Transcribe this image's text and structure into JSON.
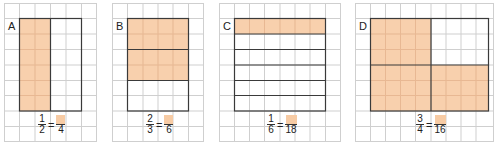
{
  "colors": {
    "shade": "#F7CBA4",
    "grid": "#cfcfcf",
    "border": "#3a3a3a"
  },
  "panels": [
    {
      "label": "A",
      "fraction": {
        "num": "1",
        "den": "2",
        "eq_den": "4"
      },
      "grid_cols": 6,
      "grid_rows": 9,
      "rect": {
        "col": 1,
        "row": 1,
        "cols": 4,
        "rows": 7
      },
      "description": "rectangle split into 2 vertical halves (2 cols each), left half shaded"
    },
    {
      "label": "B",
      "fraction": {
        "num": "2",
        "den": "3",
        "eq_den": "6"
      },
      "grid_cols": 6,
      "grid_rows": 9,
      "rect": {
        "col": 1,
        "row": 1,
        "cols": 4,
        "rows": 6
      },
      "description": "rectangle split into 3 horizontal strips (2 rows each), top 2 shaded"
    },
    {
      "label": "C",
      "fraction": {
        "num": "1",
        "den": "6",
        "eq_den": "18"
      },
      "grid_cols": 8,
      "grid_rows": 9,
      "rect": {
        "col": 1,
        "row": 1,
        "cols": 6,
        "rows": 6
      },
      "description": "rectangle split into 6 horizontal strips, top strip shaded"
    },
    {
      "label": "D",
      "fraction": {
        "num": "3",
        "den": "4",
        "eq_den": "16"
      },
      "grid_cols": 9,
      "grid_rows": 9,
      "rect": {
        "col": 1,
        "row": 1,
        "cols": 8,
        "rows": 6
      },
      "description": "rectangle split into 4 quadrants (4x3 each), 3 quadrants shaded"
    }
  ]
}
